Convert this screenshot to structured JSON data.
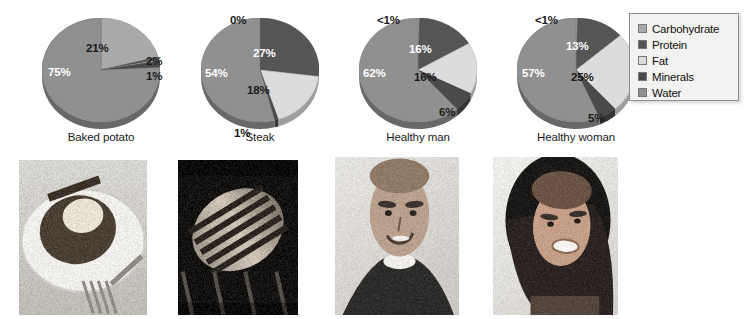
{
  "legend": {
    "title": "Nutrient legend",
    "items": [
      {
        "label": "Carbohydrate",
        "color": "#a9a9a9",
        "key": "carbohydrate"
      },
      {
        "label": "Protein",
        "color": "#555555",
        "key": "protein"
      },
      {
        "label": "Fat",
        "color": "#dcdcdc",
        "key": "fat"
      },
      {
        "label": "Minerals",
        "color": "#4a4a4a",
        "key": "minerals"
      },
      {
        "label": "Water",
        "color": "#909090",
        "key": "water"
      }
    ]
  },
  "chart_data": {
    "type": "pie",
    "legend_position": "right",
    "categories": [
      "Carbohydrate",
      "Protein",
      "Fat",
      "Minerals",
      "Water"
    ],
    "colors": [
      "#a9a9a9",
      "#555555",
      "#dcdcdc",
      "#4a4a4a",
      "#909090"
    ],
    "charts": [
      {
        "name": "Baked potato",
        "caption": "Baked potato",
        "photo": "baked-potato-photo",
        "values": [
          21,
          1,
          0.2,
          2,
          75.8
        ],
        "labels": [
          "21%",
          "2%",
          "1%",
          "",
          "75%"
        ],
        "label_positions": [
          {
            "text": "21%",
            "x": 70,
            "y": 28,
            "light": false
          },
          {
            "text": "2%",
            "x": 130,
            "y": 41,
            "light": false
          },
          {
            "text": "1%",
            "x": 130,
            "y": 56,
            "light": false
          },
          {
            "text": "75%",
            "x": 32,
            "y": 52,
            "light": true
          }
        ]
      },
      {
        "name": "Steak",
        "caption": "Steak",
        "photo": "steak-photo",
        "values": [
          0,
          27,
          18,
          1,
          54
        ],
        "labels": [
          "0%",
          "27%",
          "18%",
          "1%",
          "54%"
        ],
        "label_positions": [
          {
            "text": "0%",
            "x": 55,
            "y": 0,
            "light": false
          },
          {
            "text": "27%",
            "x": 78,
            "y": 33,
            "light": true
          },
          {
            "text": "18%",
            "x": 72,
            "y": 70,
            "light": false
          },
          {
            "text": "1%",
            "x": 59,
            "y": 113,
            "light": false
          },
          {
            "text": "54%",
            "x": 30,
            "y": 53,
            "light": true
          }
        ]
      },
      {
        "name": "Healthy man",
        "caption": "Healthy man",
        "photo": "healthy-man-photo",
        "values": [
          0.5,
          16,
          16,
          6,
          61.5
        ],
        "labels": [
          "<1%",
          "16%",
          "16%",
          "6%",
          "62%"
        ],
        "label_positions": [
          {
            "text": "<1%",
            "x": 44,
            "y": 0,
            "light": false
          },
          {
            "text": "16%",
            "x": 76,
            "y": 29,
            "light": true
          },
          {
            "text": "16%",
            "x": 81,
            "y": 57,
            "light": false
          },
          {
            "text": "6%",
            "x": 106,
            "y": 92,
            "light": false
          },
          {
            "text": "62%",
            "x": 30,
            "y": 53,
            "light": true
          }
        ]
      },
      {
        "name": "Healthy woman",
        "caption": "Healthy woman",
        "photo": "healthy-woman-photo",
        "values": [
          0.5,
          13,
          25,
          5,
          56.5
        ],
        "labels": [
          "<1%",
          "13%",
          "25%",
          "5%",
          "57%"
        ],
        "label_positions": [
          {
            "text": "<1%",
            "x": 44,
            "y": 0,
            "light": false
          },
          {
            "text": "13%",
            "x": 75,
            "y": 26,
            "light": true
          },
          {
            "text": "25%",
            "x": 80,
            "y": 57,
            "light": false
          },
          {
            "text": "5%",
            "x": 97,
            "y": 98,
            "light": false
          },
          {
            "text": "57%",
            "x": 31,
            "y": 53,
            "light": true
          }
        ]
      }
    ]
  },
  "photos": [
    {
      "name": "baked-potato-photo",
      "alt": "Baked potato on a plate with fork",
      "x": 19,
      "y": 160,
      "w": 128,
      "h": 155
    },
    {
      "name": "steak-photo",
      "alt": "Grilled steak on grill",
      "x": 178,
      "y": 160,
      "w": 120,
      "h": 155
    },
    {
      "name": "healthy-man-photo",
      "alt": "Smiling young man portrait",
      "x": 335,
      "y": 157,
      "w": 124,
      "h": 158
    },
    {
      "name": "healthy-woman-photo",
      "alt": "Smiling woman portrait",
      "x": 493,
      "y": 157,
      "w": 125,
      "h": 158
    }
  ],
  "layout": {
    "columns_x": [
      16,
      175,
      333,
      491
    ],
    "pie_geometry": {
      "cx": 59,
      "cy": 52,
      "rx": 59,
      "ry": 52,
      "depth": 7
    }
  }
}
